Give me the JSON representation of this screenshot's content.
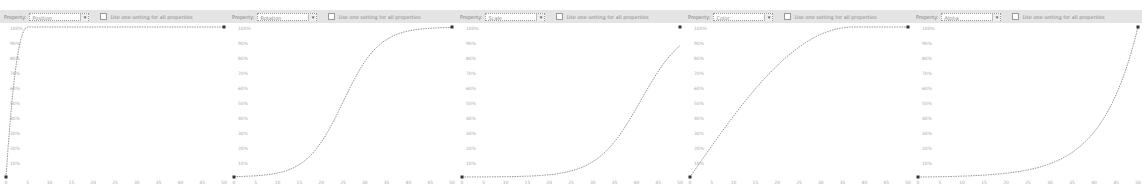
{
  "common": {
    "property_label": "Property:",
    "checkbox_label": "Use one setting for all properties",
    "y_ticks": [
      "100%",
      "90%",
      "80%",
      "70%",
      "60%",
      "50%",
      "40%",
      "30%",
      "20%",
      "10%"
    ],
    "x_ticks": [
      "0",
      "5",
      "10",
      "15",
      "20",
      "25",
      "30",
      "35",
      "40",
      "45",
      "50"
    ]
  },
  "panels": [
    {
      "property": "Position",
      "curve": "ease-out-fast"
    },
    {
      "property": "Rotation",
      "curve": "s-curve"
    },
    {
      "property": "Scale",
      "curve": "ease-in-late"
    },
    {
      "property": "Color",
      "curve": "ease-out"
    },
    {
      "property": "Alpha",
      "curve": "exponential-in"
    }
  ],
  "colors": {
    "curve": "#888888",
    "toolbar": "#e4e4e4",
    "tick_text": "#aaaaaa",
    "point": "#333333"
  }
}
